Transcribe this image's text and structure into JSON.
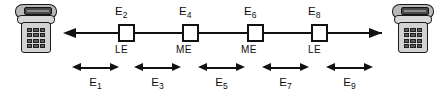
{
  "diagram": {
    "line_color": "#111111",
    "phone_body_color": "#d2d2d2",
    "phone_handset_color": "#4a4a4a"
  },
  "endpoints": [
    {
      "id": "left-telephone",
      "name": "telephone-left",
      "side": "left"
    },
    {
      "id": "right-telephone",
      "name": "telephone-right",
      "side": "right"
    }
  ],
  "nodes": [
    {
      "label": "E",
      "sub": "2",
      "type": "LE",
      "x": 118
    },
    {
      "label": "E",
      "sub": "4",
      "type": "ME",
      "x": 182
    },
    {
      "label": "E",
      "sub": "6",
      "type": "ME",
      "x": 247
    },
    {
      "label": "E",
      "sub": "8",
      "type": "LE",
      "x": 311
    }
  ],
  "segments": [
    {
      "label": "E",
      "sub": "1",
      "x": 72,
      "width": 47
    },
    {
      "label": "E",
      "sub": "3",
      "x": 134,
      "width": 47
    },
    {
      "label": "E",
      "sub": "5",
      "x": 198,
      "width": 47
    },
    {
      "label": "E",
      "sub": "7",
      "x": 262,
      "width": 47
    },
    {
      "label": "E",
      "sub": "9",
      "x": 326,
      "width": 47
    }
  ],
  "trunk": {
    "left_arrow_x": 63,
    "right_arrow_x": 381,
    "y": 33
  }
}
